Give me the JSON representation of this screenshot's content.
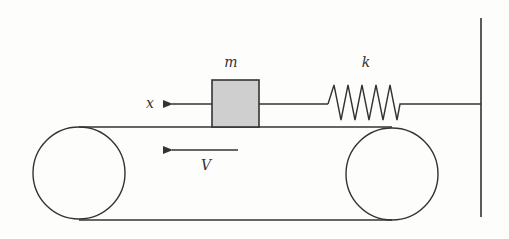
{
  "diagram": {
    "labels": {
      "mass": "m",
      "spring": "k",
      "displacement": "x",
      "velocity": "V"
    },
    "colors": {
      "stroke": "#333333",
      "mass_fill": "#cfcfcf",
      "background": "#fdfdfb"
    },
    "components": {
      "mass_block": {
        "x": 212,
        "y": 80,
        "width": 47,
        "height": 47
      },
      "spring": {
        "x_start": 328,
        "x_end": 404,
        "y": 104,
        "coils": 5
      },
      "wall": {
        "x": 481,
        "y_top": 18,
        "y_bottom": 217
      },
      "left_pulley": {
        "cx": 79,
        "cy": 173,
        "r": 46
      },
      "right_pulley": {
        "cx": 392,
        "cy": 174,
        "r": 46
      },
      "belt": {
        "top_y": 127,
        "bottom_y": 220
      }
    }
  }
}
